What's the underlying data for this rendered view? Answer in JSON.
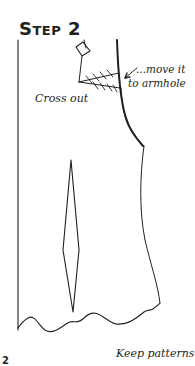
{
  "figure": {
    "title": "Step 2",
    "annotations": {
      "move": "...move it",
      "armhole": "to armhole",
      "cross_out": "Cross out",
      "keep": "Keep patterns"
    },
    "corner_mark": "2"
  },
  "colors": {
    "line": "#231f20",
    "background": "#ffffff"
  },
  "icons": {
    "arrow": "arrow-pointing-to-armhole"
  }
}
